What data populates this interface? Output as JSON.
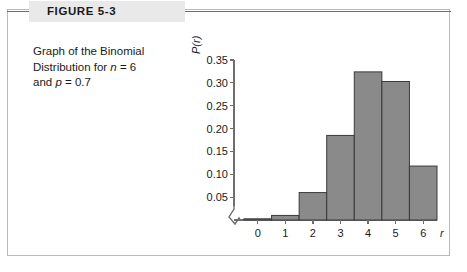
{
  "figure": {
    "label": "FIGURE 5-3",
    "caption_line1": "Graph of the Binomial",
    "caption_line2_a": "Distribution for ",
    "caption_line2_n": "n",
    "caption_line2_b": " = 6",
    "caption_line3_a": "and ",
    "caption_line3_p": "p",
    "caption_line3_b": " = 0.7"
  },
  "colors": {
    "bar_fill": "#8a8a8a",
    "bar_stroke": "#3a3a3a",
    "axis": "#6e6e6e",
    "header_band": "#e9e9e9",
    "border": "#b9b9b9"
  },
  "chart_data": {
    "type": "bar",
    "title": "",
    "xlabel": "r",
    "ylabel": "P(r)",
    "categories": [
      "0",
      "1",
      "2",
      "3",
      "4",
      "5",
      "6"
    ],
    "values": [
      0.001,
      0.01,
      0.06,
      0.185,
      0.324,
      0.303,
      0.118
    ],
    "ylim": [
      0,
      0.35
    ],
    "ytick_labels": [
      "0.05",
      "0.10",
      "0.15",
      "0.20",
      "0.25",
      "0.30",
      "0.35"
    ],
    "ytick_values": [
      0.05,
      0.1,
      0.15,
      0.2,
      0.25,
      0.3,
      0.35
    ],
    "xtick_labels": [
      "0",
      "1",
      "2",
      "3",
      "4",
      "5",
      "6"
    ],
    "grid": false,
    "legend": false,
    "axis_break": true
  }
}
